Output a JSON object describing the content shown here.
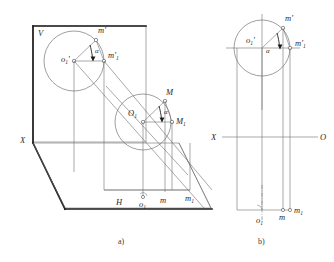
{
  "figure": {
    "title_labels": {
      "caption_a": "a)",
      "caption_b": "b)"
    },
    "panel_a": {
      "name": "pictorial-projection-view",
      "plane_labels": {
        "vertical_plane": "V",
        "horizontal_plane": "H",
        "x_axis": "X"
      },
      "frontal_circle": {
        "center_label": "o",
        "center_sub": "1",
        "center_prime": "'",
        "point_m_label": "m'",
        "point_m1_label": "m'",
        "point_m1_sub": "1",
        "angle_label": "α"
      },
      "spatial_circle": {
        "center_label": "O",
        "center_sub": "1",
        "point_m_label": "M",
        "point_m1_label": "M",
        "point_m1_sub": "1",
        "angle_label": "α"
      },
      "horizontal_projection": {
        "center_label": "o",
        "center_sub": "1",
        "point_m_label": "m",
        "point_m1_label": "m",
        "point_m1_sub": "1"
      }
    },
    "panel_b": {
      "name": "orthographic-epure-view",
      "axis_labels": {
        "x_left": "X",
        "o_right": "O"
      },
      "frontal_circle": {
        "center_label": "o",
        "center_sub": "1",
        "center_prime": "'",
        "point_m_label": "m'",
        "point_m1_label": "m'",
        "point_m1_sub": "1",
        "angle_label": "α"
      },
      "horizontal_projection": {
        "center_label": "o",
        "center_sub": "1",
        "point_m_label": "m",
        "point_m1_label": "m",
        "point_m1_sub": "1"
      }
    },
    "colors": {
      "line": "#6e6e6e",
      "heavy_line": "#1d1d1d",
      "text": "#2a2a2a",
      "background": "#ffffff"
    }
  }
}
